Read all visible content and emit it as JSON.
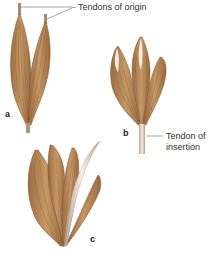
{
  "figure": {
    "panels": [
      {
        "id": "a",
        "letter": "a",
        "description": "Two-headed muscle with two tendons of origin"
      },
      {
        "id": "b",
        "letter": "b",
        "description": "Multi-headed muscle converging on single tendon of insertion"
      },
      {
        "id": "c",
        "letter": "c",
        "description": "Multi-headed muscle with long tendinous head"
      }
    ],
    "callouts": {
      "origin": "Tendons of origin",
      "insertion_line1": "Tendon of",
      "insertion_line2": "insertion"
    },
    "colors": {
      "muscle": "#b9895c",
      "muscle_dark": "#8a5e38",
      "fiber": "#7a5030",
      "tendon": "#d9c9b8",
      "tendon_highlight": "#f4eee8",
      "leader_line": "#666666"
    }
  }
}
